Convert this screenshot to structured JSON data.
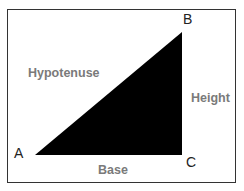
{
  "diagram": {
    "vertices": [
      {
        "label": "A",
        "x": 35,
        "y": 155
      },
      {
        "label": "B",
        "x": 182,
        "y": 32
      },
      {
        "label": "C",
        "x": 182,
        "y": 155
      }
    ],
    "sides": {
      "hypotenuse": "Hypotenuse",
      "height": "Height",
      "base": "Base"
    },
    "colors": {
      "triangle_fill": "#000000",
      "side_label": "#7a7a7a",
      "vertex_label": "#222222",
      "frame_border": "#333333"
    }
  }
}
